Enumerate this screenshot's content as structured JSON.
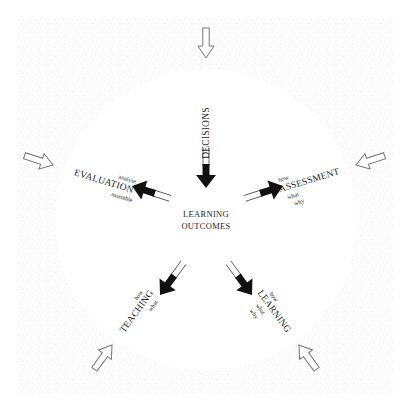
{
  "diagram": {
    "center": {
      "line1": "LEARNING",
      "line2": "OUTCOMES"
    },
    "nodes": {
      "decisions": {
        "label": "DECISIONS"
      },
      "evaluation": {
        "label": "EVALUATION",
        "above": "analyse",
        "below": "assemble"
      },
      "assessment": {
        "label": "ASSESSMENT",
        "above": "how",
        "below1": "what",
        "below2": "why"
      },
      "teaching": {
        "label": "TEACHING",
        "above": "how",
        "below": "what"
      },
      "learning": {
        "label": "LEARNING",
        "above": "how",
        "below1": "what",
        "below2": "why"
      }
    },
    "arrows": {
      "inner_count": 5,
      "outer_count": 5,
      "inner_style": "solid-black",
      "outer_style": "outline-hollow"
    },
    "colors": {
      "background": "#ffffff",
      "stipple": "#c8c8c8",
      "arrow_fill": "#111111",
      "text": "#1e1e1e"
    }
  }
}
